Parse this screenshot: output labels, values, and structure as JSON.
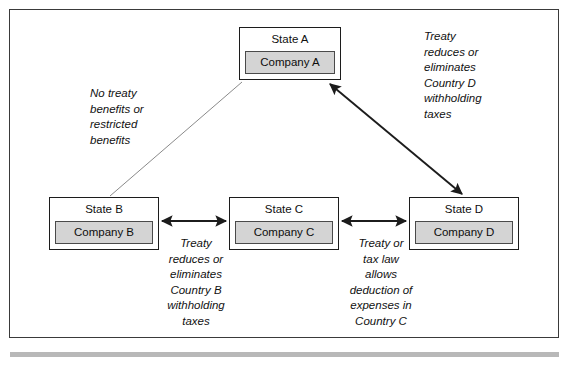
{
  "diagram": {
    "frame": {
      "border_color": "#3a3a3a"
    },
    "nodes": [
      {
        "id": "a",
        "state_label": "State A",
        "company_label": "Company A"
      },
      {
        "id": "b",
        "state_label": "State B",
        "company_label": "Company B"
      },
      {
        "id": "c",
        "state_label": "State C",
        "company_label": "Company C"
      },
      {
        "id": "d",
        "state_label": "State D",
        "company_label": "Company D"
      }
    ],
    "annotations": {
      "a_to_b": "No treaty\nbenefits or\nrestricted\nbenefits",
      "a_to_d": "Treaty\nreduces or\neliminates\nCountry D\nwithholding\ntaxes",
      "b_to_c": "Treaty\nreduces or\neliminates\nCountry B\nwithholding\ntaxes",
      "c_to_d": "Treaty or\ntax law\nallows\ndeduction of\nexpenses in\nCountry C"
    },
    "connectors": [
      {
        "id": "a-b",
        "style": "thin-plain-line",
        "heads": "none"
      },
      {
        "id": "a-d",
        "style": "thick-line",
        "heads": "both"
      },
      {
        "id": "b-c",
        "style": "thick-line",
        "heads": "both"
      },
      {
        "id": "c-d",
        "style": "thick-line",
        "heads": "both"
      }
    ],
    "colors": {
      "box_border": "#1c1c1c",
      "company_fill": "#d4d4d4",
      "company_border": "#4a4a4a",
      "line": "#1c1c1c",
      "faint_line": "#7d7d7d",
      "bottom_rule": "#b8b8b8"
    }
  }
}
